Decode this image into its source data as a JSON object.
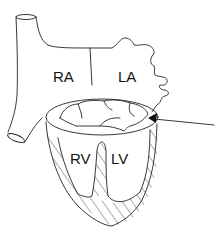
{
  "diagram": {
    "type": "heart-anatomy-cross-section",
    "labels": {
      "right_atrium": "RA",
      "left_atrium": "LA",
      "right_ventricle": "RV",
      "left_ventricle": "LV"
    },
    "annotations": [
      {
        "kind": "arrow",
        "points_to": "atrioventricular valve annulus (right edge)"
      }
    ],
    "colors": {
      "stroke": "#222222",
      "background": "#ffffff",
      "valve_shading": "#bbbbbb"
    }
  }
}
